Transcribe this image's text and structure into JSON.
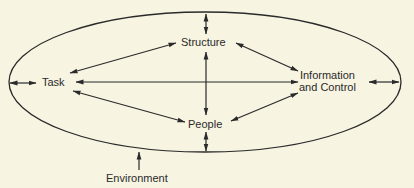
{
  "diagram": {
    "nodes": {
      "structure": "Structure",
      "task": "Task",
      "information_line1": "Information",
      "information_line2": "and Control",
      "people": "People"
    },
    "boundary_label": "Environment",
    "edges": [
      {
        "from": "Task",
        "to": "Structure",
        "type": "bidirectional"
      },
      {
        "from": "Task",
        "to": "Information and Control",
        "type": "bidirectional"
      },
      {
        "from": "Task",
        "to": "People",
        "type": "bidirectional"
      },
      {
        "from": "Structure",
        "to": "Information and Control",
        "type": "bidirectional"
      },
      {
        "from": "Structure",
        "to": "People",
        "type": "bidirectional"
      },
      {
        "from": "People",
        "to": "Information and Control",
        "type": "bidirectional"
      },
      {
        "from": "Environment",
        "to": "Structure",
        "type": "bidirectional"
      },
      {
        "from": "Environment",
        "to": "Task",
        "type": "bidirectional"
      },
      {
        "from": "Environment",
        "to": "Information and Control",
        "type": "bidirectional"
      },
      {
        "from": "Environment",
        "to": "People",
        "type": "bidirectional"
      }
    ],
    "colors": {
      "background": "#f7f4e2",
      "ink": "#2a2a2a"
    }
  }
}
